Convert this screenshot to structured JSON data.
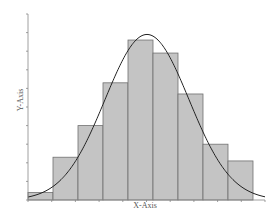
{
  "chart_data": {
    "type": "bar",
    "subtype": "histogram-with-normal-curve",
    "title": "",
    "xlabel": "X-Axis",
    "ylabel": "Y-Axis",
    "bins": 9,
    "categories": [
      "1",
      "2",
      "3",
      "4",
      "5",
      "6",
      "7",
      "8",
      "9"
    ],
    "values": [
      0.4,
      2.3,
      4.0,
      6.3,
      8.6,
      7.9,
      5.7,
      3.0,
      2.1
    ],
    "ylim": [
      0,
      10
    ],
    "y_ticks": 10,
    "x_ticks": 10,
    "tick_labels_shown": false,
    "grid": false,
    "legend": "none",
    "overlay": {
      "type": "normal-curve",
      "peak_bin": 5,
      "peak_value": 8.9
    },
    "colors": {
      "bar_fill": "#c4c4c4",
      "bar_stroke": "#707070",
      "curve": "#222222",
      "axis": "#888888"
    }
  },
  "labels": {
    "x_axis": "X-Axis",
    "y_axis": "Y-Axis"
  }
}
